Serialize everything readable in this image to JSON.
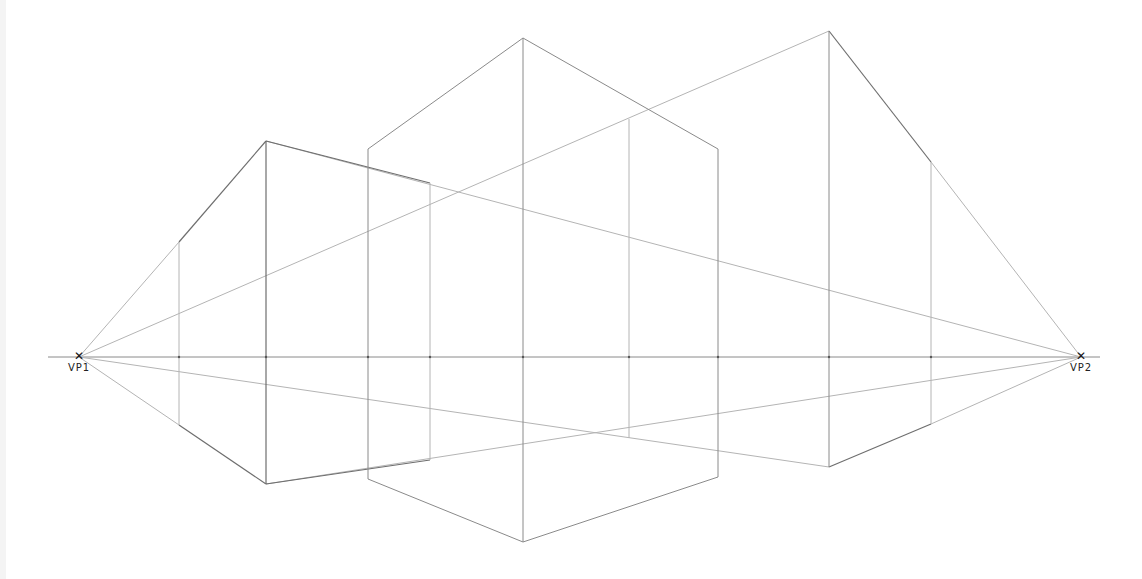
{
  "diagram": {
    "type": "two-point-perspective",
    "horizon": {
      "y": 357,
      "x1": 48,
      "x2": 1100
    },
    "vanishing_points": [
      {
        "id": "vp1",
        "label": "VP1",
        "x": 79,
        "y": 357
      },
      {
        "id": "vp2",
        "label": "VP2",
        "x": 1081,
        "y": 357
      }
    ],
    "colors": {
      "construction_line": "#b4b4b4",
      "edge_line": "#8a8a8a",
      "strong_edge": "#6e6e6e",
      "vp_mark": "#111111",
      "background": "#ffffff"
    },
    "boxes": [
      {
        "name": "left-box",
        "front_edge": {
          "x": 266,
          "top": 141,
          "bottom": 484
        },
        "left_edge": {
          "x": 179,
          "top": 242,
          "bottom": 425
        },
        "right_edge": {
          "x": 430,
          "top": 183,
          "bottom": 460
        }
      },
      {
        "name": "center-box",
        "front_edge": {
          "x": 523,
          "top": 38,
          "bottom": 542
        },
        "left_edge": {
          "x": 368,
          "top": 149,
          "bottom": 479
        },
        "right_edge": {
          "x": 718,
          "top": 149,
          "bottom": 477
        },
        "inner_edge": {
          "x": 629,
          "top": 119,
          "bottom": 438
        }
      },
      {
        "name": "right-box",
        "front_edge": {
          "x": 829,
          "top": 31,
          "bottom": 467
        },
        "right_edge": {
          "x": 931,
          "top": 162,
          "bottom": 424
        }
      }
    ],
    "horizon_ticks": [
      179,
      266,
      368,
      430,
      523,
      629,
      718,
      829,
      931
    ]
  }
}
